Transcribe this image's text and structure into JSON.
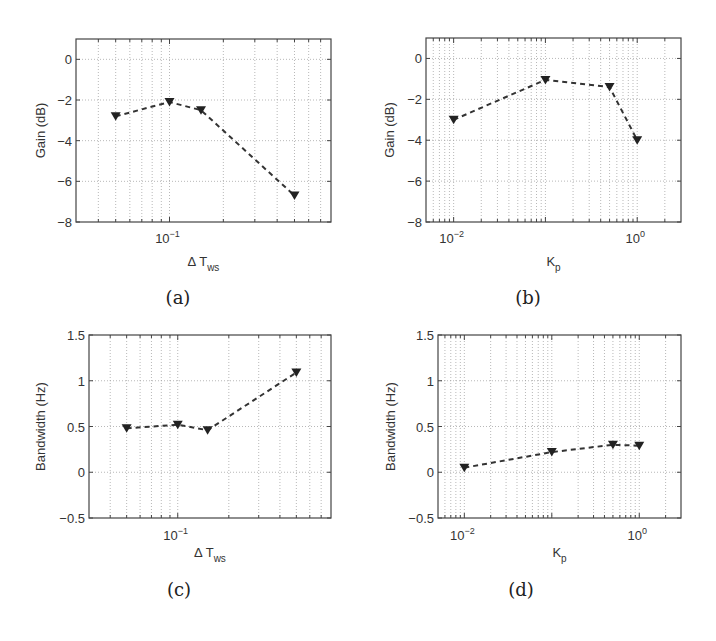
{
  "chart_data": [
    {
      "id": "a",
      "type": "line",
      "caption": "(a)",
      "xscale": "log",
      "xlim": [
        0.03,
        0.8
      ],
      "ylim": [
        -8,
        1
      ],
      "xticks": [
        {
          "value": 0.1,
          "base": "10",
          "exp": "−1"
        }
      ],
      "yticks": [
        0,
        -2,
        -4,
        -6,
        -8
      ],
      "xlabel": {
        "main": "Δ T",
        "sub": "ws"
      },
      "ylabel": "Gain (dB)",
      "grid": true,
      "marker": "triangle-down",
      "line_style": "dashed",
      "x": [
        0.05,
        0.1,
        0.15,
        0.5
      ],
      "y": [
        -2.8,
        -2.1,
        -2.5,
        -6.7
      ]
    },
    {
      "id": "b",
      "type": "line",
      "caption": "(b)",
      "xscale": "log",
      "xlim": [
        0.005,
        3
      ],
      "ylim": [
        -8,
        1
      ],
      "xticks": [
        {
          "value": 0.01,
          "base": "10",
          "exp": "−2"
        },
        {
          "value": 1,
          "base": "10",
          "exp": "0"
        }
      ],
      "yticks": [
        0,
        -2,
        -4,
        -6,
        -8
      ],
      "xlabel": {
        "main": "K",
        "sub": "p"
      },
      "ylabel": "Gain (dB)",
      "grid": true,
      "marker": "triangle-down",
      "line_style": "dashed",
      "x": [
        0.01,
        0.1,
        0.5,
        1.0
      ],
      "y": [
        -3.0,
        -1.05,
        -1.4,
        -4.0
      ]
    },
    {
      "id": "c",
      "type": "line",
      "caption": "(c)",
      "xscale": "log",
      "xlim": [
        0.03,
        0.8
      ],
      "ylim": [
        -0.5,
        1.5
      ],
      "xticks": [
        {
          "value": 0.1,
          "base": "10",
          "exp": "−1"
        }
      ],
      "yticks": [
        1.5,
        1,
        0.5,
        0,
        -0.5
      ],
      "xlabel": {
        "main": "Δ T",
        "sub": "ws"
      },
      "ylabel": "Bandwidth (Hz)",
      "grid": true,
      "marker": "triangle-down",
      "line_style": "dashed",
      "x": [
        0.05,
        0.1,
        0.15,
        0.5
      ],
      "y": [
        0.48,
        0.52,
        0.46,
        1.09
      ]
    },
    {
      "id": "d",
      "type": "line",
      "caption": "(d)",
      "xscale": "log",
      "xlim": [
        0.005,
        3
      ],
      "ylim": [
        -0.5,
        1.5
      ],
      "xticks": [
        {
          "value": 0.01,
          "base": "10",
          "exp": "−2"
        },
        {
          "value": 1,
          "base": "10",
          "exp": "0"
        }
      ],
      "yticks": [
        1.5,
        1,
        0.5,
        0,
        -0.5
      ],
      "xlabel": {
        "main": "K",
        "sub": "p"
      },
      "ylabel": "Bandwidth (Hz)",
      "grid": true,
      "marker": "triangle-down",
      "line_style": "dashed",
      "x": [
        0.01,
        0.1,
        0.5,
        1.0
      ],
      "y": [
        0.05,
        0.22,
        0.3,
        0.29
      ]
    }
  ]
}
